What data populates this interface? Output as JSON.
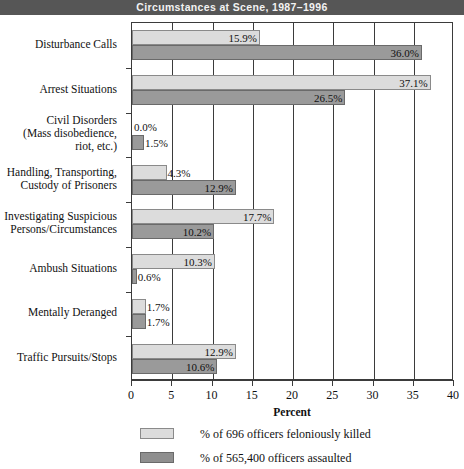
{
  "header": {
    "title": "Circumstances at Scene, 1987–1996",
    "band_color": "#565656"
  },
  "chart_data": {
    "type": "bar",
    "orientation": "horizontal",
    "title": "Circumstances at Scene, 1987–1996",
    "xlabel": "Percent",
    "ylabel": "",
    "xlim": [
      0,
      40
    ],
    "xticks": [
      0,
      5,
      10,
      15,
      20,
      25,
      30,
      35,
      40
    ],
    "xtick_labels": [
      "0",
      "5",
      "10",
      "15",
      "20",
      "25",
      "30",
      "35",
      "40"
    ],
    "grid": true,
    "legend_position": "below",
    "categories": [
      "Disturbance Calls",
      "Arrest Situations",
      "Civil Disorders\n(Mass disobedience,\nriot, etc.)",
      "Handling, Transporting,\nCustody of Prisoners",
      "Investigating Suspicious\nPersons/Circumstances",
      "Ambush Situations",
      "Mentally Deranged",
      "Traffic Pursuits/Stops"
    ],
    "series": [
      {
        "name": "% of  696 officers feloniously killed",
        "color": "#dcdcdc",
        "values": [
          15.9,
          37.1,
          0.0,
          4.3,
          17.7,
          10.3,
          1.7,
          12.9
        ],
        "value_labels": [
          "15.9%",
          "37.1%",
          "0.0%",
          "4.3%",
          "17.7%",
          "10.3%",
          "1.7%",
          "12.9%"
        ]
      },
      {
        "name": "% of 565,400 officers assaulted",
        "color": "#9a9a9a",
        "values": [
          36.0,
          26.5,
          1.5,
          12.9,
          10.2,
          0.6,
          1.7,
          10.6
        ],
        "value_labels": [
          "36.0%",
          "26.5%",
          "1.5%",
          "12.9%",
          "10.2%",
          "0.6%",
          "1.7%",
          "10.6%"
        ]
      }
    ]
  },
  "legend": {
    "items": [
      {
        "label": "% of  696 officers feloniously killed",
        "swatch": "light"
      },
      {
        "label": "% of 565,400 officers assaulted",
        "swatch": "dark"
      }
    ]
  }
}
